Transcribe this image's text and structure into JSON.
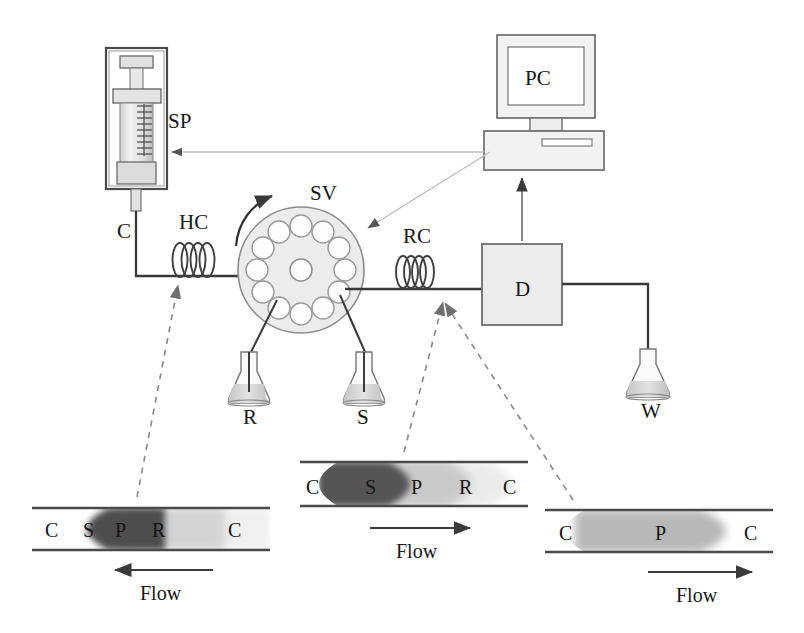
{
  "figure": {
    "background_color": "#ffffff",
    "line_color": "#3a3a3a",
    "control_line_color": "#b4b4b4",
    "dashed_line_color": "#8d8d8d"
  },
  "components": [
    {
      "id": "SP",
      "label": "SP",
      "name": "syringe-pump",
      "label_x": 168,
      "label_y": 128
    },
    {
      "id": "C",
      "label": "C",
      "name": "carrier-line",
      "label_x": 117,
      "label_y": 238
    },
    {
      "id": "HC",
      "label": "HC",
      "name": "holding-coil",
      "label_x": 192,
      "label_y": 229
    },
    {
      "id": "SV",
      "label": "SV",
      "name": "selection-valve",
      "label_x": 322,
      "label_y": 200
    },
    {
      "id": "RC",
      "label": "RC",
      "name": "reaction-coil",
      "label_x": 420,
      "label_y": 243
    },
    {
      "id": "D",
      "label": "D",
      "name": "detector",
      "label_x": 524,
      "label_y": 289
    },
    {
      "id": "PC",
      "label": "PC",
      "name": "personal-computer",
      "label_x": 545,
      "label_y": 85
    },
    {
      "id": "R",
      "label": "R",
      "name": "reagent-flask",
      "label_x": 253,
      "label_y": 412
    },
    {
      "id": "S",
      "label": "S",
      "name": "sample-flask",
      "label_x": 367,
      "label_y": 412
    },
    {
      "id": "W",
      "label": "W",
      "name": "waste-flask",
      "label_x": 636,
      "label_y": 404
    }
  ],
  "selection_valve": {
    "center_x": 301,
    "center_y": 270,
    "radius": 63,
    "port_count": 12,
    "port_radius": 11,
    "port_ring_radius": 44,
    "center_port_radius": 11,
    "fill": "#ececec",
    "stroke": "#8a8a8a",
    "rotation_arrow": "clockwise"
  },
  "flow_zones": [
    {
      "name": "flow-diagram-left",
      "x": 32,
      "y": 508,
      "width": 238,
      "height": 42,
      "direction": "left",
      "flow_label": "Flow",
      "arrow_x1": 213,
      "arrow_x2": 115,
      "arrow_y": 570,
      "flow_label_x": 164,
      "flow_label_y": 600,
      "labels": [
        {
          "text": "C",
          "x": 52,
          "y": 536
        },
        {
          "text": "S",
          "x": 90,
          "y": 536
        },
        {
          "text": "P",
          "x": 122,
          "y": 536
        },
        {
          "text": "R",
          "x": 158,
          "y": 536
        },
        {
          "text": "C",
          "x": 232,
          "y": 536
        }
      ],
      "bands": [
        {
          "zone": "R",
          "color": "#efefef",
          "tip": 0.3,
          "tail": 1.0
        },
        {
          "zone": "P",
          "color": "#d6d6d6",
          "tip": 0.22,
          "tail": 0.82
        },
        {
          "zone": "S",
          "color": "#4f4f4f",
          "tip": 0.16,
          "tail": 0.58
        }
      ]
    },
    {
      "name": "flow-diagram-middle",
      "x": 300,
      "y": 462,
      "width": 228,
      "height": 44,
      "direction": "right",
      "flow_label": "Flow",
      "arrow_x1": 370,
      "arrow_x2": 470,
      "arrow_y": 528,
      "flow_label_x": 420,
      "flow_label_y": 558,
      "labels": [
        {
          "text": "C",
          "x": 313,
          "y": 492
        },
        {
          "text": "S",
          "x": 372,
          "y": 492
        },
        {
          "text": "P",
          "x": 418,
          "y": 492
        },
        {
          "text": "R",
          "x": 466,
          "y": 492
        },
        {
          "text": "C",
          "x": 508,
          "y": 492
        }
      ],
      "bands": [
        {
          "zone": "R",
          "color": "#e8e8e8",
          "tip": 0.96,
          "tail": 0.1
        },
        {
          "zone": "P",
          "color": "#c9c9c9",
          "tip": 0.8,
          "tail": 0.12
        },
        {
          "zone": "S",
          "color": "#585858",
          "tip": 0.52,
          "tail": 0.14
        }
      ]
    },
    {
      "name": "flow-diagram-right",
      "x": 545,
      "y": 510,
      "width": 228,
      "height": 42,
      "direction": "right",
      "flow_label": "Flow",
      "arrow_x1": 648,
      "arrow_x2": 752,
      "arrow_y": 572,
      "flow_label_x": 700,
      "flow_label_y": 602,
      "labels": [
        {
          "text": "C",
          "x": 566,
          "y": 538
        },
        {
          "text": "P",
          "x": 662,
          "y": 538
        },
        {
          "text": "C",
          "x": 750,
          "y": 538
        }
      ],
      "bands": [
        {
          "zone": "P",
          "color": "#b9b9b9",
          "tip": 0.84,
          "tail": 0.14
        }
      ]
    }
  ],
  "connectors": [
    {
      "name": "pc-to-syringe-pump-control",
      "type": "control",
      "target": "SP"
    },
    {
      "name": "pc-to-selection-valve-control",
      "type": "control",
      "target": "SV"
    },
    {
      "name": "detector-to-pc-signal",
      "type": "signal",
      "target": "PC"
    },
    {
      "name": "holding-coil-callout",
      "type": "dashed",
      "target": "HC"
    },
    {
      "name": "reaction-coil-inlet-callout",
      "type": "dashed",
      "target": "RC-inlet"
    },
    {
      "name": "reaction-coil-outlet-callout",
      "type": "dashed",
      "target": "RC-outlet"
    }
  ]
}
